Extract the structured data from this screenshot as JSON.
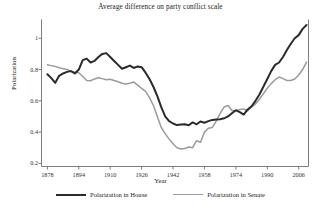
{
  "chart_data": {
    "type": "line",
    "title": "Average difference on party conflict scale",
    "xlabel": "Year",
    "ylabel": "Polarization",
    "xlim": [
      1875,
      2011
    ],
    "ylim": [
      0.18,
      1.12
    ],
    "grid": false,
    "legend_position": "below",
    "xticks": [
      "1878",
      "1894",
      "1910",
      "1926",
      "1942",
      "1958",
      "1974",
      "1990",
      "2006"
    ],
    "xtick_values": [
      1878,
      1894,
      1910,
      1926,
      1942,
      1958,
      1974,
      1990,
      2006
    ],
    "yticks": [
      "0.2",
      "0.4",
      "0.6",
      "0.8",
      "1"
    ],
    "ytick_values": [
      0.2,
      0.4,
      0.6,
      0.8,
      1.0
    ],
    "colors": {
      "house": "#2b2b2b",
      "senate": "#9b9b9b",
      "axis": "#6e6e6e",
      "background": "#ffffff",
      "text": "#222222"
    },
    "x": [
      1878,
      1880,
      1882,
      1884,
      1886,
      1888,
      1890,
      1892,
      1894,
      1896,
      1898,
      1900,
      1902,
      1904,
      1906,
      1908,
      1910,
      1912,
      1914,
      1916,
      1918,
      1920,
      1922,
      1924,
      1926,
      1928,
      1930,
      1932,
      1934,
      1936,
      1938,
      1940,
      1942,
      1944,
      1946,
      1948,
      1950,
      1952,
      1954,
      1956,
      1958,
      1960,
      1962,
      1964,
      1966,
      1968,
      1970,
      1972,
      1974,
      1976,
      1978,
      1980,
      1982,
      1984,
      1986,
      1988,
      1990,
      1992,
      1994,
      1996,
      1998,
      2000,
      2002,
      2004,
      2006,
      2008,
      2010
    ],
    "series": [
      {
        "name": "Polarization in House",
        "color": "#2b2b2b",
        "values": [
          0.77,
          0.745,
          0.715,
          0.76,
          0.775,
          0.785,
          0.79,
          0.775,
          0.8,
          0.86,
          0.87,
          0.845,
          0.855,
          0.88,
          0.9,
          0.905,
          0.88,
          0.855,
          0.83,
          0.805,
          0.815,
          0.825,
          0.81,
          0.82,
          0.815,
          0.78,
          0.74,
          0.69,
          0.63,
          0.56,
          0.5,
          0.47,
          0.455,
          0.445,
          0.448,
          0.45,
          0.444,
          0.462,
          0.45,
          0.468,
          0.46,
          0.47,
          0.478,
          0.48,
          0.482,
          0.488,
          0.5,
          0.52,
          0.54,
          0.528,
          0.512,
          0.545,
          0.565,
          0.6,
          0.64,
          0.69,
          0.74,
          0.79,
          0.83,
          0.845,
          0.88,
          0.925,
          0.965,
          1.0,
          1.02,
          1.06,
          1.085
        ]
      },
      {
        "name": "Polarization in Senate",
        "color": "#9b9b9b",
        "values": [
          0.83,
          0.825,
          0.82,
          0.812,
          0.805,
          0.8,
          0.79,
          0.782,
          0.78,
          0.755,
          0.73,
          0.728,
          0.74,
          0.748,
          0.742,
          0.735,
          0.738,
          0.73,
          0.722,
          0.712,
          0.708,
          0.712,
          0.72,
          0.7,
          0.68,
          0.66,
          0.62,
          0.57,
          0.5,
          0.43,
          0.39,
          0.355,
          0.325,
          0.3,
          0.292,
          0.295,
          0.305,
          0.3,
          0.345,
          0.335,
          0.4,
          0.425,
          0.43,
          0.47,
          0.52,
          0.56,
          0.57,
          0.538,
          0.535,
          0.545,
          0.548,
          0.535,
          0.56,
          0.58,
          0.61,
          0.645,
          0.68,
          0.71,
          0.735,
          0.752,
          0.742,
          0.73,
          0.73,
          0.74,
          0.765,
          0.8,
          0.848
        ]
      }
    ]
  }
}
